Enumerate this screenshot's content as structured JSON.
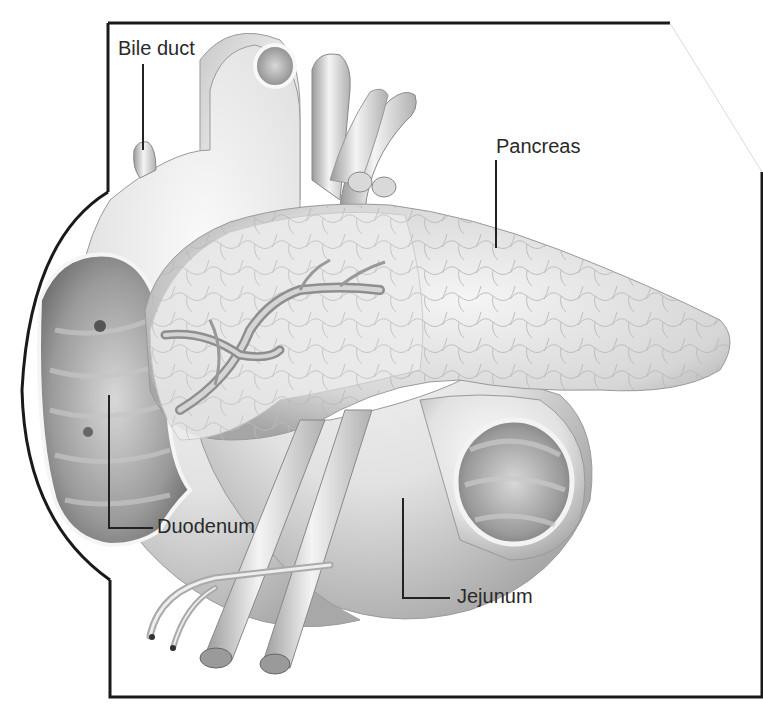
{
  "labels": {
    "bile_duct": "Bile duct",
    "pancreas": "Pancreas",
    "duodenum": "Duodenum",
    "jejunum": "Jejunum"
  },
  "colors": {
    "frame": "#1a1a1a",
    "organ_light": "#f2f2f2",
    "organ_mid": "#cfcfcf",
    "organ_dark": "#8a8a8a",
    "leader_line": "#222222"
  }
}
